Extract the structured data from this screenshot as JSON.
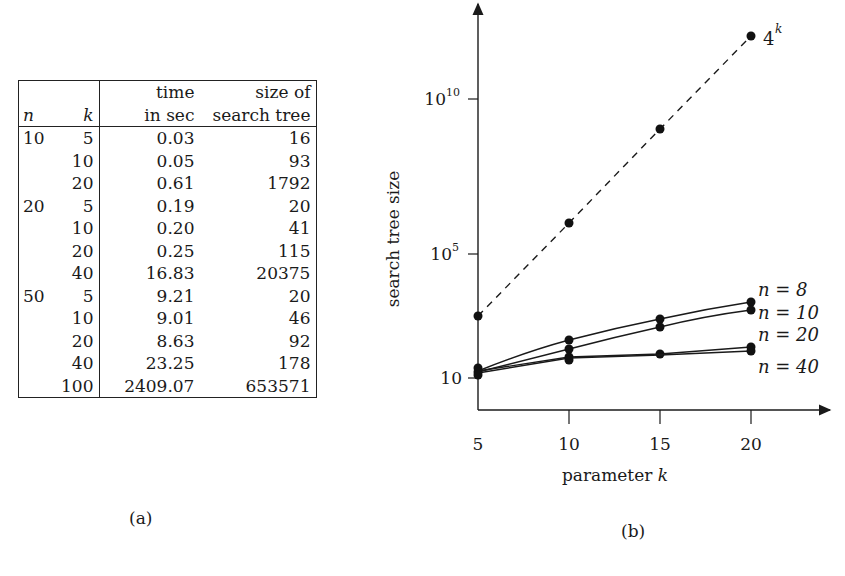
{
  "panel_a": {
    "caption": "(a)",
    "headers": {
      "n": "n",
      "k": "k",
      "time_line1": "time",
      "time_line2": "in sec",
      "size_line1": "size of",
      "size_line2": "search tree"
    },
    "rows": [
      {
        "n": "10",
        "k": "5",
        "time": "0.03",
        "size": "16"
      },
      {
        "n": "",
        "k": "10",
        "time": "0.05",
        "size": "93"
      },
      {
        "n": "",
        "k": "20",
        "time": "0.61",
        "size": "1792"
      },
      {
        "n": "20",
        "k": "5",
        "time": "0.19",
        "size": "20"
      },
      {
        "n": "",
        "k": "10",
        "time": "0.20",
        "size": "41"
      },
      {
        "n": "",
        "k": "20",
        "time": "0.25",
        "size": "115"
      },
      {
        "n": "",
        "k": "40",
        "time": "16.83",
        "size": "20375"
      },
      {
        "n": "50",
        "k": "5",
        "time": "9.21",
        "size": "20"
      },
      {
        "n": "",
        "k": "10",
        "time": "9.01",
        "size": "46"
      },
      {
        "n": "",
        "k": "20",
        "time": "8.63",
        "size": "92"
      },
      {
        "n": "",
        "k": "40",
        "time": "23.25",
        "size": "178"
      },
      {
        "n": "",
        "k": "100",
        "time": "2409.07",
        "size": "653571"
      }
    ]
  },
  "panel_b": {
    "caption": "(b)",
    "xlabel_text": "parameter ",
    "xlabel_var": "k",
    "ylabel": "search tree size",
    "xticks": [
      "5",
      "10",
      "15",
      "20"
    ],
    "yticks": [
      {
        "base": "10",
        "exp": ""
      },
      {
        "base": "10",
        "exp": "5"
      },
      {
        "base": "10",
        "exp": "10"
      }
    ],
    "labels": {
      "fourk_base": "4",
      "fourk_exp": "k",
      "n8": "n = 8",
      "n10": "n = 10",
      "n20": "n = 20",
      "n40": "n = 40"
    }
  },
  "chart_data": [
    {
      "type": "table",
      "title": "(a)",
      "columns": [
        "n",
        "k",
        "time in sec",
        "size of search tree"
      ],
      "rows": [
        [
          10,
          5,
          0.03,
          16
        ],
        [
          10,
          10,
          0.05,
          93
        ],
        [
          10,
          20,
          0.61,
          1792
        ],
        [
          20,
          5,
          0.19,
          20
        ],
        [
          20,
          10,
          0.2,
          41
        ],
        [
          20,
          20,
          0.25,
          115
        ],
        [
          20,
          40,
          16.83,
          20375
        ],
        [
          50,
          5,
          9.21,
          20
        ],
        [
          50,
          10,
          9.01,
          46
        ],
        [
          50,
          20,
          8.63,
          92
        ],
        [
          50,
          40,
          23.25,
          178
        ],
        [
          50,
          100,
          2409.07,
          653571
        ]
      ]
    },
    {
      "type": "line",
      "title": "(b)",
      "xlabel": "parameter k",
      "ylabel": "search tree size",
      "yscale": "log",
      "x": [
        5,
        10,
        15,
        20
      ],
      "xlim": [
        5,
        24
      ],
      "ylim": [
        1,
        10000000000000.0
      ],
      "ytick_labels": [
        "10",
        "10^5",
        "10^10"
      ],
      "xtick_labels": [
        "5",
        "10",
        "15",
        "20"
      ],
      "grid": false,
      "legend": "inline labels at right end of lines",
      "series": [
        {
          "name": "4^k",
          "style": "dashed",
          "values": [
            1024,
            1048576,
            1073741824,
            1099511627776
          ]
        },
        {
          "name": "n = 8",
          "style": "solid",
          "values": [
            18,
            160,
            750,
            2800
          ]
        },
        {
          "name": "n = 10",
          "style": "solid",
          "values": [
            16,
            93,
            450,
            1792
          ]
        },
        {
          "name": "n = 20",
          "style": "solid",
          "values": [
            20,
            41,
            45,
            115
          ]
        },
        {
          "name": "n = 40",
          "style": "solid",
          "values": [
            18,
            40,
            45,
            92
          ]
        }
      ]
    }
  ]
}
